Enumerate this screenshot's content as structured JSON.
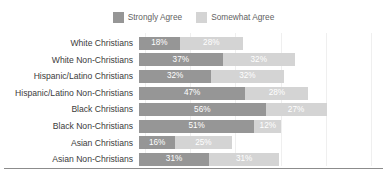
{
  "legend": {
    "position": "top-center",
    "entries": [
      {
        "label": "Strongly Agree",
        "color": "#969696",
        "swatch_name": "legend-swatch-strongly-agree"
      },
      {
        "label": "Somewhat Agree",
        "color": "#d4d4d4",
        "swatch_name": "legend-swatch-somewhat-agree"
      }
    ]
  },
  "chart_data": {
    "type": "bar",
    "orientation": "horizontal",
    "stacked": true,
    "title": "",
    "subtitle": "",
    "xlabel": "",
    "ylabel": "",
    "xlim": [
      0,
      100
    ],
    "grid": true,
    "grid_axis": "x",
    "legend_position": "top-center",
    "categories": [
      "White Christians",
      "White Non-Christians",
      "Hispanic/Latino Christians",
      "Hispanic/Latino Non-Christians",
      "Black Christians",
      "Black Non-Christians",
      "Asian Christians",
      "Asian Non-Christians"
    ],
    "series": [
      {
        "name": "Strongly Agree",
        "color": "#969696",
        "values": [
          18,
          37,
          32,
          47,
          56,
          51,
          16,
          31
        ],
        "labels": [
          "18%",
          "37%",
          "32%",
          "47%",
          "56%",
          "51%",
          "16%",
          "31%"
        ]
      },
      {
        "name": "Somewhat Agree",
        "color": "#d4d4d4",
        "values": [
          28,
          32,
          32,
          28,
          27,
          12,
          25,
          31
        ],
        "labels": [
          "28%",
          "32%",
          "32%",
          "28%",
          "27%",
          "12%",
          "25%",
          "31%"
        ]
      }
    ],
    "totals": [
      46,
      69,
      64,
      75,
      83,
      63,
      41,
      62
    ],
    "gridline_values": [
      0,
      20,
      40,
      60,
      80,
      100
    ]
  },
  "style": {
    "background": "#ffffff",
    "gridline_color": "#efefef",
    "bottom_rule_color": "#8c8c8c",
    "label_color": "#3b3b3b",
    "legend_label_color": "#5f5f5f",
    "value_label_color": "#ffffff"
  }
}
